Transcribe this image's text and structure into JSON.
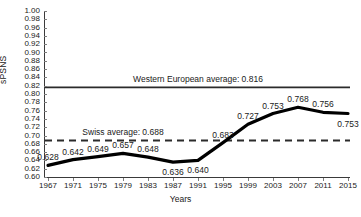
{
  "chart_data": {
    "type": "line",
    "title": "",
    "xlabel": "Years",
    "ylabel": "sPSNS",
    "x": [
      1967,
      1971,
      1975,
      1979,
      1983,
      1987,
      1991,
      1995,
      1999,
      2003,
      2007,
      2011,
      2015
    ],
    "xtick_labels": [
      "1967",
      "1971",
      "1975",
      "1979",
      "1983",
      "1987",
      "1991",
      "1995",
      "1999",
      "2003",
      "2007",
      "2011",
      "2015"
    ],
    "values": [
      0.628,
      0.642,
      0.649,
      0.657,
      0.648,
      0.636,
      0.64,
      0.683,
      0.727,
      0.753,
      0.768,
      0.756,
      0.753
    ],
    "point_labels": [
      "0.628",
      "0.642",
      "0.649",
      "0.657",
      "0.648",
      "0.636",
      "0.640",
      "0.683",
      "0.727",
      "0.753",
      "0.768",
      "0.756",
      "0.753"
    ],
    "point_label_pos": [
      "above",
      "above",
      "above",
      "above",
      "above",
      "below",
      "below",
      "above",
      "above",
      "above",
      "above",
      "above",
      "below"
    ],
    "xlim": [
      1967,
      2015
    ],
    "ylim": [
      0.6,
      1.0
    ],
    "ytick_labels": [
      "1.00",
      "0.98",
      "0.96",
      "0.94",
      "0.92",
      "0.90",
      "0.88",
      "0.86",
      "0.84",
      "0.82",
      "0.80",
      "0.78",
      "0.76",
      "0.74",
      "0.72",
      "0.70",
      "0.68",
      "0.66",
      "0.64",
      "0.62",
      "0.60"
    ],
    "ytick_values": [
      1.0,
      0.98,
      0.96,
      0.94,
      0.92,
      0.9,
      0.88,
      0.86,
      0.84,
      0.82,
      0.8,
      0.78,
      0.76,
      0.74,
      0.72,
      0.7,
      0.68,
      0.66,
      0.64,
      0.62,
      0.6
    ],
    "grid": false,
    "legend": "none",
    "series_color": "#000000",
    "reference_lines": [
      {
        "name": "western-european-average",
        "label": "Western European average: 0.816",
        "value": 0.816,
        "style": "solid",
        "color": "#2b2b2b",
        "label_x": 1991
      },
      {
        "name": "swiss-average",
        "label": "Swiss average: 0.688",
        "value": 0.688,
        "style": "dashed",
        "color": "#2b2b2b",
        "label_x": 1979
      }
    ]
  }
}
